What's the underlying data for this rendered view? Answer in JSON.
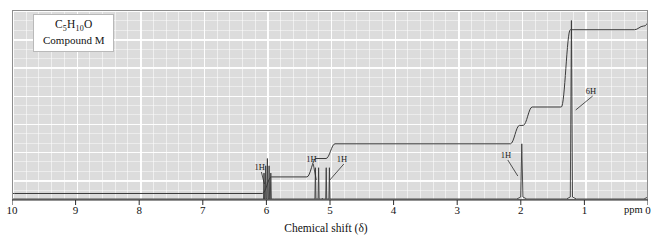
{
  "caption": {
    "formula_prefix": "C",
    "formula_sub1": "5",
    "formula_mid": "H",
    "formula_sub2": "10",
    "formula_suffix": "O",
    "compound": "Compound M"
  },
  "axis": {
    "title": "Chemical shift (δ)",
    "unit_label": "ppm",
    "ticks": [
      "10",
      "9",
      "8",
      "7",
      "6",
      "5",
      "4",
      "3",
      "2",
      "1",
      "0"
    ],
    "min": 0,
    "max": 10,
    "direction": "reversed"
  },
  "annotations": [
    {
      "label": "1H",
      "ppm": 6.0
    },
    {
      "label": "1H",
      "ppm": 5.2
    },
    {
      "label": "1H",
      "ppm": 5.05
    },
    {
      "label": "1H",
      "ppm": 2.0
    },
    {
      "label": "6H",
      "ppm": 1.2
    }
  ],
  "colors": {
    "plot_background": "#dcdcdc",
    "gridline": "#ffffff",
    "trace": "#3a3a3a",
    "integration": "#3a3a3a",
    "border": "#8e8e8e",
    "text": "#111111"
  },
  "chart_data": {
    "type": "line",
    "title": "",
    "xlabel": "Chemical shift (δ)",
    "ylabel": "",
    "xlim": [
      10,
      0
    ],
    "ylim": [
      0,
      100
    ],
    "grid": true,
    "legend": "none",
    "series": [
      {
        "name": "1H NMR spectrum",
        "peaks": [
          {
            "ppm": 6.0,
            "height": 22,
            "integration": "1H",
            "multiplicity": "multiplet"
          },
          {
            "ppm": 5.22,
            "height": 17,
            "integration": "1H",
            "multiplicity": "doublet"
          },
          {
            "ppm": 5.05,
            "height": 17,
            "integration": "1H",
            "multiplicity": "doublet"
          },
          {
            "ppm": 2.0,
            "height": 30,
            "integration": "1H",
            "multiplicity": "singlet"
          },
          {
            "ppm": 1.22,
            "height": 97,
            "integration": "6H",
            "multiplicity": "singlet"
          },
          {
            "ppm": 0.0,
            "height": 12,
            "integration": "TMS",
            "multiplicity": "singlet"
          }
        ]
      },
      {
        "name": "Integration trace",
        "steps": [
          {
            "ppm": 10.0,
            "level": 3
          },
          {
            "ppm": 6.0,
            "level": 12
          },
          {
            "ppm": 5.3,
            "level": 22
          },
          {
            "ppm": 5.0,
            "level": 30
          },
          {
            "ppm": 2.1,
            "level": 40
          },
          {
            "ppm": 1.9,
            "level": 50
          },
          {
            "ppm": 1.3,
            "level": 92
          },
          {
            "ppm": 0.15,
            "level": 94
          },
          {
            "ppm": 0.0,
            "level": 99
          }
        ]
      }
    ]
  }
}
